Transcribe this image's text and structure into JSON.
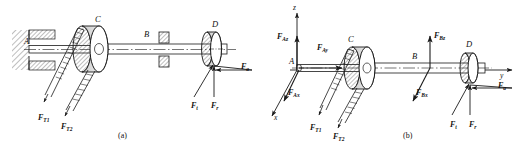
{
  "figure": {
    "panels": [
      {
        "id": "a",
        "caption": "(a)",
        "points": [
          {
            "name": "A",
            "label": "A"
          },
          {
            "name": "C",
            "label": "C"
          },
          {
            "name": "B",
            "label": "B"
          },
          {
            "name": "D",
            "label": "D"
          }
        ],
        "forces": [
          {
            "name": "belt-tension-1",
            "symbol": "F",
            "sub": "T1",
            "direction": "down-left"
          },
          {
            "name": "belt-tension-2",
            "symbol": "F",
            "sub": "T2",
            "direction": "down-left"
          },
          {
            "name": "gear-tangential",
            "symbol": "F",
            "sub": "t",
            "direction": "up-right"
          },
          {
            "name": "gear-radial",
            "symbol": "F",
            "sub": "r",
            "direction": "up"
          },
          {
            "name": "gear-axial",
            "symbol": "F",
            "sub": "a",
            "direction": "left"
          }
        ],
        "components": [
          {
            "name": "fixed-support",
            "at": "A"
          },
          {
            "name": "belt-pulley",
            "at": "C"
          },
          {
            "name": "bearing",
            "at": "B"
          },
          {
            "name": "gear",
            "at": "D"
          },
          {
            "name": "shaft",
            "at": "A-D"
          }
        ]
      },
      {
        "id": "b",
        "caption": "(b)",
        "points": [
          {
            "name": "A",
            "label": "A"
          },
          {
            "name": "C",
            "label": "C"
          },
          {
            "name": "B",
            "label": "B"
          },
          {
            "name": "D",
            "label": "D"
          }
        ],
        "axes": [
          {
            "name": "z-axis",
            "label": "z",
            "direction": "up"
          },
          {
            "name": "y-axis",
            "label": "y",
            "direction": "right"
          },
          {
            "name": "x-axis",
            "label": "x",
            "direction": "down-left"
          }
        ],
        "forces": [
          {
            "name": "reaction-A-z",
            "symbol": "F",
            "sub": "Az",
            "direction": "up"
          },
          {
            "name": "reaction-A-y",
            "symbol": "F",
            "sub": "Ay",
            "direction": "right"
          },
          {
            "name": "reaction-A-x",
            "symbol": "F",
            "sub": "Ax",
            "direction": "down-left"
          },
          {
            "name": "belt-tension-1",
            "symbol": "F",
            "sub": "T1",
            "direction": "down-left"
          },
          {
            "name": "belt-tension-2",
            "symbol": "F",
            "sub": "T2",
            "direction": "down-left"
          },
          {
            "name": "reaction-B-z",
            "symbol": "F",
            "sub": "Bz",
            "direction": "up"
          },
          {
            "name": "reaction-B-x",
            "symbol": "F",
            "sub": "Bx",
            "direction": "down-left"
          },
          {
            "name": "gear-tangential",
            "symbol": "F",
            "sub": "t",
            "direction": "up-right"
          },
          {
            "name": "gear-radial",
            "symbol": "F",
            "sub": "r",
            "direction": "up"
          },
          {
            "name": "gear-axial",
            "symbol": "F",
            "sub": "a",
            "direction": "left"
          }
        ],
        "components": [
          {
            "name": "belt-pulley",
            "at": "C"
          },
          {
            "name": "gear",
            "at": "D"
          },
          {
            "name": "shaft",
            "at": "A-D"
          }
        ]
      }
    ],
    "colors": {
      "line": "#1a1a1a",
      "hatch": "#555555",
      "shade": "#bfbfbf",
      "background": "#ffffff"
    }
  }
}
